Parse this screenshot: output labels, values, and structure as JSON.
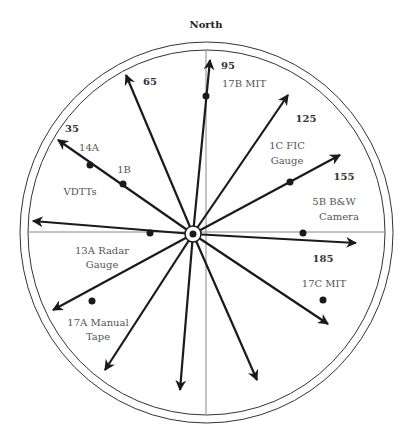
{
  "title": "North",
  "angles": [
    {
      "value": "35"
    },
    {
      "value": "65"
    },
    {
      "value": "95"
    },
    {
      "value": "125"
    },
    {
      "value": "155"
    },
    {
      "value": "185"
    }
  ],
  "instruments": [
    {
      "label": "14A"
    },
    {
      "label": "1B"
    },
    {
      "label": "VDTTs"
    },
    {
      "label": "17B MIT"
    },
    {
      "label": "1C FIC",
      "label2": "Gauge"
    },
    {
      "label": "5B B&W",
      "label2": "Camera"
    },
    {
      "label": "13A Radar",
      "label2": "Gauge"
    },
    {
      "label": "17C MIT"
    },
    {
      "label": "17A  Manual",
      "label2": "Tape"
    }
  ],
  "colors": {
    "arrow": "#1a1a1a",
    "circle": "#333333",
    "axis": "#888888",
    "text": "#555555"
  }
}
